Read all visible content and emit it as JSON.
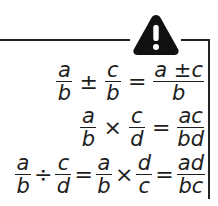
{
  "warning_icon": "warning-triangle-exclamation",
  "colors": {
    "ink": "#1e1e1e",
    "background": "#ffffff"
  },
  "formulas": [
    {
      "name": "add-subtract",
      "terms": [
        {
          "num": "a",
          "den": "b"
        },
        {
          "op": "±"
        },
        {
          "num": "c",
          "den": "b"
        },
        {
          "op": "="
        },
        {
          "num": "a ±c",
          "den": "b"
        }
      ]
    },
    {
      "name": "multiply",
      "terms": [
        {
          "num": "a",
          "den": "b"
        },
        {
          "op": "×"
        },
        {
          "num": "c",
          "den": "d"
        },
        {
          "op": "="
        },
        {
          "num": "ac",
          "den": "bd"
        }
      ]
    },
    {
      "name": "divide",
      "terms": [
        {
          "num": "a",
          "den": "b"
        },
        {
          "op": "÷"
        },
        {
          "num": "c",
          "den": "d"
        },
        {
          "op": "="
        },
        {
          "num": "a",
          "den": "b"
        },
        {
          "op": "×"
        },
        {
          "num": "d",
          "den": "c"
        },
        {
          "op": "="
        },
        {
          "num": "ad",
          "den": "bc"
        }
      ]
    }
  ]
}
